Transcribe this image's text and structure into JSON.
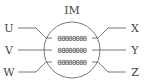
{
  "diagram": {
    "title": "IM",
    "left_terminals": [
      "U",
      "V",
      "W"
    ],
    "right_terminals": [
      "X",
      "Y",
      "Z"
    ],
    "coils": [
      {
        "text": "00000000"
      },
      {
        "text": "00000000"
      },
      {
        "text": "00000000"
      }
    ],
    "colors": {
      "stroke": "#555555",
      "text": "#444444",
      "background": "#ffffff"
    }
  }
}
